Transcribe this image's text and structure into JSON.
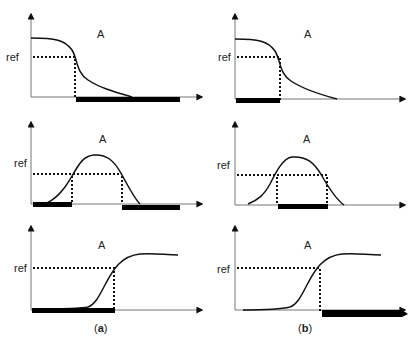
{
  "figure": {
    "panel_label": "A",
    "ref_label": "ref",
    "captions": [
      {
        "open": "(",
        "letter": "a",
        "close": ")"
      },
      {
        "open": "(",
        "letter": "b",
        "close": ")"
      }
    ],
    "colors": {
      "axis": "#777777",
      "curve": "#111111",
      "bar": "#000000",
      "dotted": "#111111"
    }
  },
  "panels": [
    {
      "col": "a",
      "row": 1,
      "shape": "decreasing sigmoid",
      "highlight": "above-crossing (right side)"
    },
    {
      "col": "b",
      "row": 1,
      "shape": "decreasing sigmoid",
      "highlight": "below-crossing (left side)"
    },
    {
      "col": "a",
      "row": 2,
      "shape": "bell/peak",
      "highlight": "outside peak (both tails)"
    },
    {
      "col": "b",
      "row": 2,
      "shape": "bell/peak",
      "highlight": "within peak region"
    },
    {
      "col": "a",
      "row": 3,
      "shape": "increasing sigmoid",
      "highlight": "before crossing (left side)"
    },
    {
      "col": "b",
      "row": 3,
      "shape": "increasing sigmoid",
      "highlight": "after crossing (right side)"
    }
  ]
}
